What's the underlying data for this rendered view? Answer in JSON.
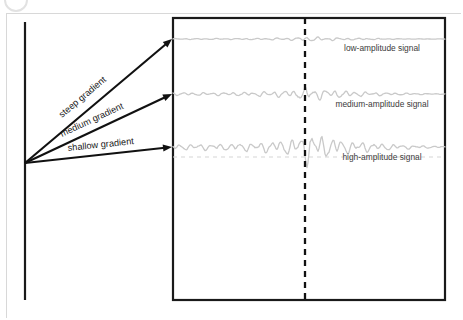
{
  "figure": {
    "kind": "diagram",
    "background_color": "#ffffff",
    "frame_color": "#d8d8d8",
    "ink_color": "#1a1a1a",
    "wave_color": "#c9c9c9"
  },
  "corner_badge": {
    "name": "corner-badge",
    "shape": "circle-outline"
  },
  "axis": {
    "name": "vertical-axis",
    "x": 25,
    "y_top": 22,
    "y_bottom": 300
  },
  "plot_area": {
    "name": "signal-plot-rectangle",
    "left": 173,
    "top": 18,
    "right": 445,
    "bottom": 300
  },
  "marker": {
    "name": "onset-marker",
    "label": "",
    "x": 305,
    "y_top": 18,
    "y_bottom": 300,
    "style": "dashed"
  },
  "arrows": [
    {
      "name": "steep-gradient-arrow",
      "label": "steep gradient",
      "from_x": 25,
      "from_y": 163,
      "to_x": 172,
      "to_y": 39,
      "label_angle": -40,
      "label_x": 62,
      "label_y": 118
    },
    {
      "name": "medium-gradient-arrow",
      "label": "medium gradient",
      "from_x": 25,
      "from_y": 163,
      "to_x": 172,
      "to_y": 94,
      "label_angle": -25,
      "label_x": 62,
      "label_y": 137
    },
    {
      "name": "shallow-gradient-arrow",
      "label": "shallow gradient",
      "from_x": 25,
      "from_y": 163,
      "to_x": 172,
      "to_y": 147,
      "label_angle": -6,
      "label_x": 68,
      "label_y": 151
    }
  ],
  "signals": [
    {
      "name": "low-amplitude-signal",
      "label": "low-amplitude signal",
      "baseline_y": 39,
      "amplitude_before": 1.1,
      "amplitude_peak": 2.2,
      "label_x": 382,
      "label_y": 51,
      "show_baseline": false
    },
    {
      "name": "medium-amplitude-signal",
      "label": "medium-amplitude signal",
      "baseline_y": 94,
      "amplitude_before": 3.2,
      "amplitude_peak": 6.5,
      "label_x": 382,
      "label_y": 107,
      "show_baseline": false
    },
    {
      "name": "high-amplitude-signal",
      "label": "high-amplitude signal",
      "baseline_y": 147,
      "amplitude_before": 6.5,
      "amplitude_peak": 15,
      "label_x": 382,
      "label_y": 160,
      "show_baseline": true
    }
  ]
}
